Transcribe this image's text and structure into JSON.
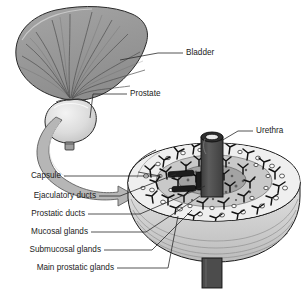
{
  "figure": {
    "background_color": "#ffffff",
    "ink_color": "#1b1b1b"
  },
  "palette": {
    "bladder_fill": "#9b9b9b",
    "bladder_shade": "#8a8a8a",
    "bladder_line": "#4a4a4a",
    "prostate_fill": "#d9d9d9",
    "prostate_highlight": "#efefef",
    "arrow_fill": "#b4b4b4",
    "arrow_stroke": "#5e5e5e",
    "capsule_fill": "#f2f2f2",
    "outer_zone_fill": "#ececec",
    "middle_zone_fill": "#bdbdbd",
    "inner_zone_fill": "#9a9a9a",
    "urethra_fill": "#4f4f4f",
    "urethra_top": "#3a3a3a",
    "gland_dark": "#141414",
    "side_wall_fill": "#cfcfcf"
  },
  "labels": {
    "bladder": "Bladder",
    "prostate": "Prostate",
    "urethra": "Urethra",
    "capsule": "Capsule",
    "ejaculatory_ducts": "Ejaculatory ducts",
    "prostatic_ducts": "Prostatic ducts",
    "mucosal_glands": "Mucosal glands",
    "submucosal_glands": "Submucosal glands",
    "main_prostatic_glands": "Main prostatic glands"
  },
  "label_positions": {
    "bladder": {
      "x": 186,
      "y": 53
    },
    "prostate": {
      "x": 130,
      "y": 94
    },
    "urethra": {
      "x": 256,
      "y": 131
    },
    "capsule": {
      "x": 61,
      "y": 176
    },
    "ejaculatory_ducts": {
      "x": 96,
      "y": 196
    },
    "prostatic_ducts": {
      "x": 85,
      "y": 214
    },
    "mucosal_glands": {
      "x": 88,
      "y": 232
    },
    "submucosal_glands": {
      "x": 101,
      "y": 250
    },
    "main_prostatic_glands": {
      "x": 114,
      "y": 268
    }
  },
  "parts": [
    {
      "name": "bladder",
      "description": "fan-shaped bladder with radiating muscular striations"
    },
    {
      "name": "prostate",
      "description": "rounded prostate gland below the bladder neck"
    },
    {
      "name": "urethra",
      "description": "dark cylindrical tube passing through the prostate center"
    },
    {
      "name": "capsule",
      "description": "outer fibrous capsule of the prostate"
    },
    {
      "name": "ejaculatory-ducts",
      "description": "paired tubes entering the central zone"
    },
    {
      "name": "prostatic-ducts",
      "description": "branching ducts draining toward the urethra"
    },
    {
      "name": "mucosal-glands",
      "description": "innermost small glands around the urethra"
    },
    {
      "name": "submucosal-glands",
      "description": "intermediate glandular layer"
    },
    {
      "name": "main-prostatic-glands",
      "description": "outermost largest glandular zone"
    }
  ]
}
